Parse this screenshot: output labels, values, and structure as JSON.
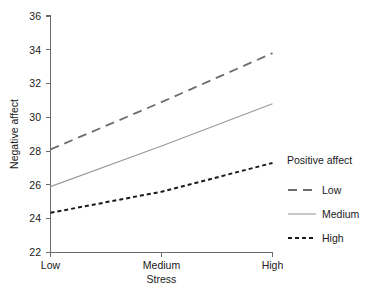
{
  "chart_data": {
    "type": "line",
    "title": "",
    "xlabel": "Stress",
    "ylabel": "Negative affect",
    "categories": [
      "Low",
      "Medium",
      "High"
    ],
    "xticklabels": [
      "Low",
      "Medium",
      "High"
    ],
    "yticklabels": [
      "22",
      "24",
      "26",
      "28",
      "30",
      "32",
      "34",
      "36"
    ],
    "yticks": [
      22,
      24,
      26,
      28,
      30,
      32,
      34,
      36
    ],
    "ylim": [
      22,
      36
    ],
    "xlim": [
      0,
      2
    ],
    "grid": false,
    "legend_position": "right",
    "legend_title": "Positive affect",
    "series": [
      {
        "name": "Low",
        "values": [
          28.1,
          30.9,
          33.8
        ],
        "style": "dashed",
        "color": "#6e6e6e",
        "width": 1.8,
        "dash": "9,6"
      },
      {
        "name": "Medium",
        "values": [
          25.9,
          28.3,
          30.8
        ],
        "style": "solid",
        "color": "#9a9a9a",
        "width": 1.1,
        "dash": "none"
      },
      {
        "name": "High",
        "values": [
          24.35,
          25.6,
          27.3
        ],
        "style": "dotted",
        "color": "#1a1a1a",
        "width": 2.0,
        "dash": "4,3"
      }
    ]
  },
  "axes": {
    "y_title": "Negative affect",
    "x_title": "Stress",
    "y_tick_0": "22",
    "y_tick_1": "24",
    "y_tick_2": "26",
    "y_tick_3": "28",
    "y_tick_4": "30",
    "y_tick_5": "32",
    "y_tick_6": "34",
    "y_tick_7": "36",
    "x_tick_0": "Low",
    "x_tick_1": "Medium",
    "x_tick_2": "High"
  },
  "legend": {
    "title": "Positive affect",
    "items": [
      {
        "label": "Low"
      },
      {
        "label": "Medium"
      },
      {
        "label": "High"
      }
    ]
  }
}
